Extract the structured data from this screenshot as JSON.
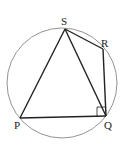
{
  "diagram": {
    "type": "cyclic-quadrilateral",
    "circle": {
      "cx": 62,
      "cy": 83,
      "r": 55
    },
    "points": {
      "S": {
        "label": "S",
        "x": 65,
        "y": 29,
        "lx": 61,
        "ly": 24
      },
      "R": {
        "label": "R",
        "x": 103,
        "y": 49,
        "lx": 102,
        "ly": 46
      },
      "Q": {
        "label": "Q",
        "x": 106,
        "y": 116,
        "lx": 105,
        "ly": 128
      },
      "P": {
        "label": "P",
        "x": 20,
        "y": 118,
        "lx": 15,
        "ly": 129
      }
    },
    "segments": [
      "SR",
      "RQ",
      "QP",
      "PS",
      "SQ"
    ],
    "right_angle_at": "Q",
    "colors": {
      "stroke": "#222222",
      "circle": "#777777"
    }
  }
}
